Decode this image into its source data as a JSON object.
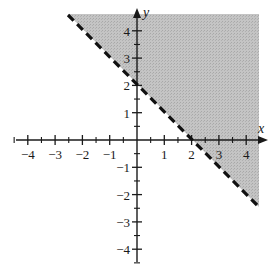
{
  "chart_data": {
    "type": "inequality-graph",
    "title": "",
    "xlabel": "x",
    "ylabel": "y",
    "xlim": [
      -4.5,
      4.5
    ],
    "ylim": [
      -4.5,
      4.5
    ],
    "x_ticks": [
      -4,
      -3,
      -2,
      -1,
      1,
      2,
      3,
      4
    ],
    "y_ticks": [
      -4,
      -3,
      -2,
      -1,
      1,
      2,
      3,
      4
    ],
    "minor_ticks_step": 0.5,
    "boundary_line": {
      "equation": "y = -x + 2",
      "slope": -1,
      "intercept": 2,
      "style": "dashed",
      "points": [
        [
          -2.5,
          4.5
        ],
        [
          4.5,
          -2.5
        ]
      ],
      "x_intercept": 2,
      "y_intercept": 2
    },
    "shaded_region": {
      "inequality": "y > -x + 2",
      "side": "above-right",
      "polygon": [
        [
          -2.5,
          4.5
        ],
        [
          4.5,
          4.5
        ],
        [
          4.5,
          -2.5
        ]
      ],
      "color": "#bdbdbd"
    },
    "grid": false,
    "legend": null
  },
  "labels": {
    "x_axis": "x",
    "y_axis": "y",
    "x_ticks": [
      "−4",
      "−3",
      "−2",
      "−1",
      "1",
      "2",
      "3",
      "4"
    ],
    "y_ticks": [
      "4",
      "3",
      "2",
      "1",
      "−1",
      "−2",
      "−3",
      "−4"
    ]
  },
  "colors": {
    "axis": "#1a1a1a",
    "shade": "#bdbdbd",
    "line": "#111111"
  }
}
